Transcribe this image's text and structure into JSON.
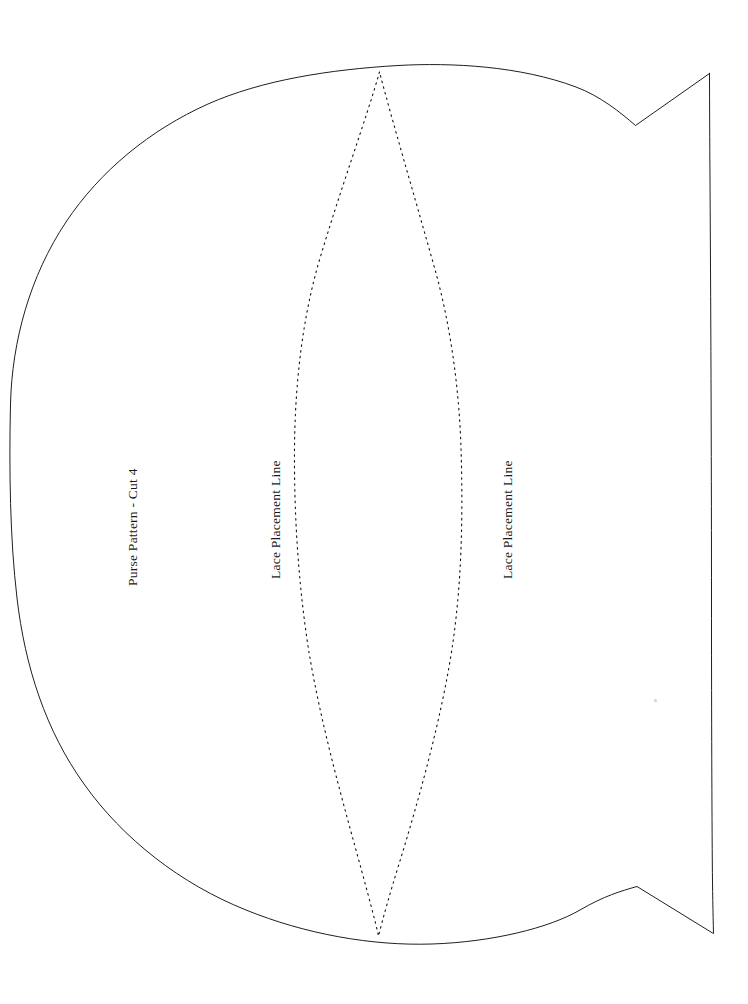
{
  "document": {
    "kind": "sewing-pattern-sheet",
    "background_color": "#ffffff",
    "ink_color": "#1f1f1f",
    "width": 748,
    "height": 1004
  },
  "labels": {
    "pattern_title": "Purse Pattern - Cut 4",
    "lace_line_left": "Lace Placement Line",
    "lace_line_right": "Lace Placement Line"
  },
  "shapes": {
    "body_outline": {
      "name": "purse-body-outline",
      "stroke": "#1f1f1f",
      "stroke_width": 1,
      "style": "solid",
      "fill": "none"
    },
    "lace_lens": {
      "name": "lace-placement-lens",
      "stroke": "#111111",
      "stroke_width": 1.1,
      "style": "dotted",
      "dash_pattern": "1.6 4.2",
      "fill": "none"
    },
    "notches": {
      "top_right": "v-notch",
      "bottom_right": "v-notch"
    }
  },
  "artifacts": {
    "scan_speck": "scan-speck"
  }
}
